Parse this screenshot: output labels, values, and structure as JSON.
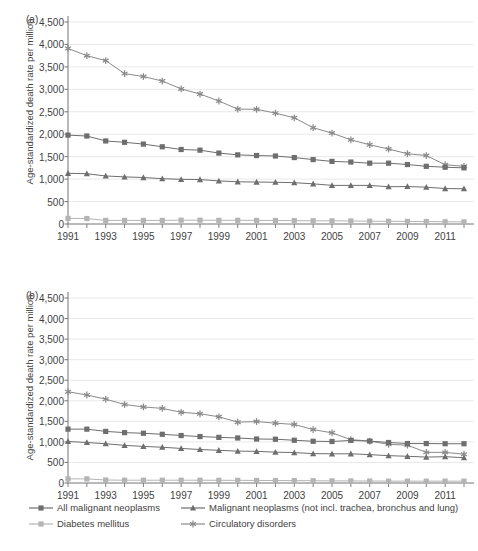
{
  "figure": {
    "panels": [
      {
        "label": "(a)",
        "id": "a"
      },
      {
        "label": "(b)",
        "id": "b"
      }
    ],
    "ylabel": "Age-standardized death rate per million",
    "yticks": [
      "0",
      "500",
      "1,000",
      "1,500",
      "2,000",
      "2,500",
      "3,000",
      "3,500",
      "4,000",
      "4,500"
    ],
    "xticks": [
      "1991",
      "1993",
      "1995",
      "1997",
      "1999",
      "2001",
      "2003",
      "2005",
      "2007",
      "2009",
      "2011"
    ]
  },
  "legend": {
    "items": [
      {
        "label": "All malignant neoplasms",
        "marker": "square",
        "color": "#6e6e6e"
      },
      {
        "label": "Malignant neoplasms (not incl. trachea, bronchus and lung)",
        "marker": "triangle",
        "color": "#6e6e6e"
      },
      {
        "label": "Diabetes mellitus",
        "marker": "square",
        "color": "#b4b4b4"
      },
      {
        "label": "Circulatory disorders",
        "marker": "star",
        "color": "#8a8a8a"
      }
    ]
  },
  "colors": {
    "neoplasms_all": "#6e6e6e",
    "neoplasms_excl": "#6e6e6e",
    "diabetes": "#b4b4b4",
    "circulatory": "#8a8a8a",
    "axis": "#808080",
    "grid": "#e2e2e2",
    "text": "#3f3f3f"
  },
  "chart_data": [
    {
      "type": "line",
      "panel": "(a)",
      "title": "",
      "xlabel": "",
      "ylabel": "Age-standardized death rate per million",
      "xlim": [
        1991,
        2012
      ],
      "ylim": [
        0,
        4500
      ],
      "grid": true,
      "legend_position": "below-figure",
      "x": [
        1991,
        1992,
        1993,
        1994,
        1995,
        1996,
        1997,
        1998,
        1999,
        2000,
        2001,
        2002,
        2003,
        2004,
        2005,
        2006,
        2007,
        2008,
        2009,
        2010,
        2011,
        2012
      ],
      "series": [
        {
          "name": "Circulatory disorders",
          "marker": "star",
          "values": [
            3910,
            3750,
            3640,
            3350,
            3285,
            3185,
            3010,
            2895,
            2740,
            2560,
            2555,
            2470,
            2365,
            2145,
            2025,
            1875,
            1765,
            1670,
            1565,
            1525,
            1320,
            1285
          ]
        },
        {
          "name": "All malignant neoplasms",
          "marker": "square",
          "values": [
            1980,
            1960,
            1850,
            1820,
            1780,
            1720,
            1660,
            1645,
            1580,
            1540,
            1525,
            1515,
            1480,
            1435,
            1395,
            1380,
            1355,
            1355,
            1325,
            1285,
            1265,
            1250
          ]
        },
        {
          "name": "Malignant neoplasms (not incl. trachea, bronchus and lung)",
          "marker": "triangle",
          "values": [
            1130,
            1120,
            1070,
            1050,
            1035,
            1010,
            995,
            990,
            960,
            940,
            935,
            930,
            920,
            895,
            860,
            860,
            860,
            830,
            835,
            820,
            790,
            785
          ]
        },
        {
          "name": "Diabetes mellitus",
          "marker": "square-light",
          "values": [
            125,
            122,
            80,
            80,
            80,
            80,
            85,
            85,
            82,
            82,
            80,
            78,
            75,
            72,
            70,
            68,
            62,
            60,
            58,
            55,
            50,
            48
          ]
        }
      ]
    },
    {
      "type": "line",
      "panel": "(b)",
      "title": "",
      "xlabel": "",
      "ylabel": "Age-standardized death rate per million",
      "xlim": [
        1991,
        2012
      ],
      "ylim": [
        0,
        4500
      ],
      "grid": true,
      "legend_position": "below-figure",
      "x": [
        1991,
        1992,
        1993,
        1994,
        1995,
        1996,
        1997,
        1998,
        1999,
        2000,
        2001,
        2002,
        2003,
        2004,
        2005,
        2006,
        2007,
        2008,
        2009,
        2010,
        2011,
        2012
      ],
      "series": [
        {
          "name": "Circulatory disorders",
          "marker": "star",
          "values": [
            2220,
            2140,
            2040,
            1910,
            1850,
            1815,
            1720,
            1685,
            1610,
            1480,
            1495,
            1455,
            1425,
            1300,
            1220,
            1055,
            1020,
            940,
            920,
            745,
            745,
            700
          ]
        },
        {
          "name": "All malignant neoplasms",
          "marker": "square",
          "values": [
            1310,
            1310,
            1255,
            1225,
            1210,
            1185,
            1155,
            1130,
            1110,
            1095,
            1070,
            1065,
            1040,
            1015,
            1010,
            1035,
            1020,
            985,
            960,
            960,
            955,
            955
          ]
        },
        {
          "name": "Malignant neoplasms (not incl. trachea, bronchus and lung)",
          "marker": "triangle",
          "values": [
            1010,
            985,
            955,
            915,
            890,
            870,
            840,
            815,
            795,
            775,
            770,
            750,
            740,
            715,
            710,
            710,
            690,
            665,
            650,
            630,
            640,
            615
          ]
        },
        {
          "name": "Diabetes mellitus",
          "marker": "square-light",
          "values": [
            100,
            100,
            72,
            68,
            68,
            68,
            68,
            68,
            65,
            65,
            62,
            60,
            58,
            55,
            52,
            50,
            48,
            45,
            45,
            45,
            45,
            45
          ]
        }
      ]
    }
  ]
}
